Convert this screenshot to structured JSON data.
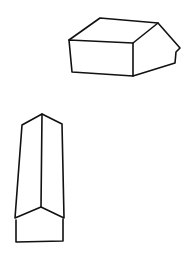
{
  "canvas": {
    "width": 195,
    "height": 261,
    "background": "#ffffff",
    "ink": "#111111"
  },
  "figures": [
    {
      "name": "house-horizontal",
      "description": "Sketch of a wide gabled house viewed from above at an angle"
    },
    {
      "name": "house-vertical",
      "description": "Sketch of a tall gabled roof prism viewed from the gable end"
    }
  ]
}
